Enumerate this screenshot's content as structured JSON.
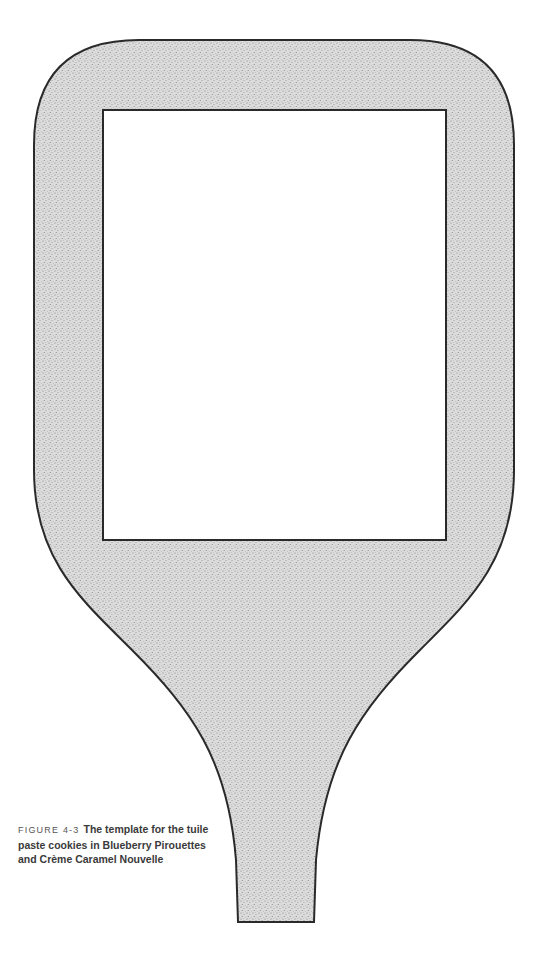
{
  "figure": {
    "label": "FIGURE 4-3",
    "caption_lines": [
      "The template for the tuile",
      "paste cookies in Blueberry Pirouettes",
      "and Crème Caramel Nouvelle"
    ],
    "template_shape": "tuile-paddle-template",
    "colors": {
      "stipple_fill": "#d6d6d6",
      "stipple_dot": "#8a8a8a",
      "outline": "#2a2a2a",
      "cutout": "#ffffff"
    }
  }
}
